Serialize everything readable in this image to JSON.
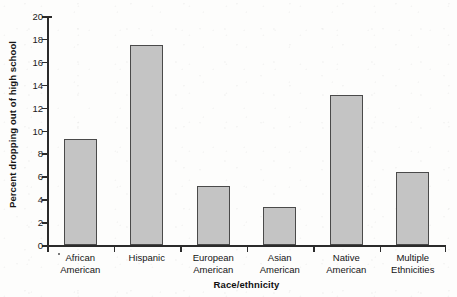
{
  "chart_data": {
    "type": "bar",
    "title": "",
    "xlabel": "Race/ethnicity",
    "ylabel": "Percent dropping out of high school",
    "categories": [
      "African American",
      "Hispanic",
      "European American",
      "Asian American",
      "Native American",
      "Multiple Ethnicities"
    ],
    "category_lines": [
      [
        "African",
        "American"
      ],
      [
        "Hispanic",
        ""
      ],
      [
        "European",
        "American"
      ],
      [
        "Asian",
        "American"
      ],
      [
        "Native",
        "American"
      ],
      [
        "Multiple",
        "Ethnicities"
      ]
    ],
    "values": [
      9.3,
      17.5,
      5.15,
      3.3,
      13.1,
      6.4
    ],
    "ylim": [
      0,
      20
    ],
    "yticks": [
      0,
      2,
      4,
      6,
      8,
      10,
      12,
      14,
      16,
      18,
      20
    ],
    "ytick_labels": [
      "0",
      "2",
      "4",
      "6",
      "8",
      "10",
      "12",
      "14",
      "16",
      "18",
      "20"
    ],
    "grid": false,
    "legend": "none",
    "bar_color": "#c4c4c4",
    "bar_border_color": "#4a4a4a",
    "axis_color": "#2b2b2b",
    "background": "#fdfdfc"
  }
}
